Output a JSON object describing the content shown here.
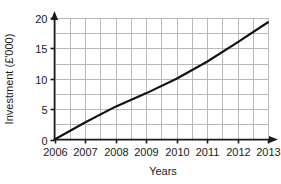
{
  "chart_data": {
    "type": "line",
    "title": "",
    "subtitle": "",
    "xlabel": "Years",
    "ylabel": "Investment (£'000)",
    "xlim": [
      2006,
      2013
    ],
    "ylim": [
      0,
      20
    ],
    "x": [
      2006,
      2007,
      2008,
      2009,
      2010,
      2011,
      2012,
      2013
    ],
    "xtick_labels": [
      "2006",
      "2007",
      "2008",
      "2009",
      "2010",
      "2011",
      "2012",
      "2013"
    ],
    "ytick_values": [
      0,
      5,
      10,
      15,
      20
    ],
    "ytick_labels": [
      "0",
      "5",
      "10",
      "15",
      "20"
    ],
    "grid": true,
    "grid_minor_x_step": 0.5,
    "grid_minor_y_step": 2.5,
    "legend": "none",
    "series": [
      {
        "name": "Investment",
        "color": "#111111",
        "values": [
          0,
          2.8,
          5.4,
          7.6,
          10.0,
          12.8,
          16.0,
          19.3
        ]
      }
    ],
    "annotations": []
  },
  "style": {
    "axis_color": "#1a1a1a",
    "grid_color": "#b8b8b8",
    "line_color": "#111111",
    "background": "#ffffff"
  }
}
